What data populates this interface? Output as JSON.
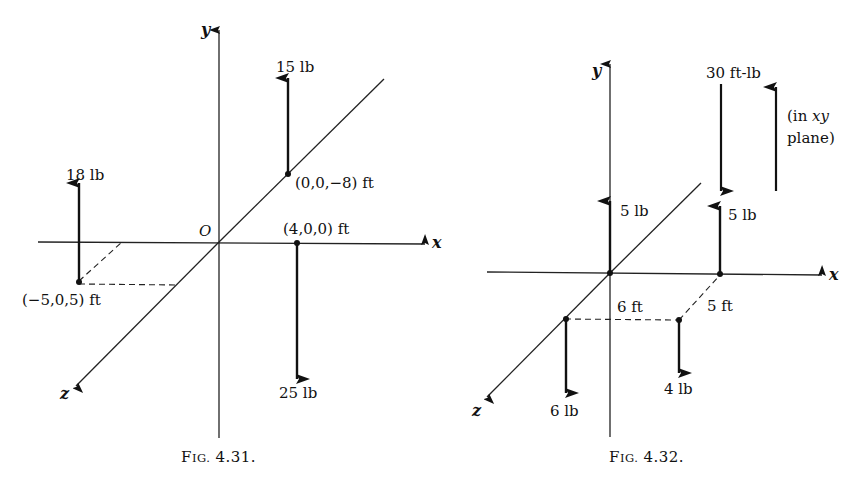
{
  "figures": [
    {
      "id": "fig-4-31",
      "caption": {
        "prefix": "F",
        "smallcaps": "IG.",
        "number": "4.31."
      },
      "axes": {
        "x": "x",
        "y": "y",
        "z": "z",
        "origin": "O"
      },
      "forces": [
        {
          "magnitude": "18 lb",
          "direction": "up",
          "point": "(−5,0,5) ft"
        },
        {
          "magnitude": "15 lb",
          "direction": "up",
          "point": "(0,0,−8) ft"
        },
        {
          "magnitude": "25 lb",
          "direction": "down",
          "point": "(4,0,0) ft"
        }
      ]
    },
    {
      "id": "fig-4-32",
      "caption": {
        "prefix": "F",
        "smallcaps": "IG.",
        "number": "4.32."
      },
      "axes": {
        "x": "x",
        "y": "y",
        "z": "z"
      },
      "forces": [
        {
          "magnitude": "5 lb",
          "direction": "up",
          "location": "origin"
        },
        {
          "magnitude": "5 lb",
          "direction": "up",
          "location": "on x axis"
        },
        {
          "magnitude": "6 lb",
          "direction": "down",
          "location": "on z axis"
        },
        {
          "magnitude": "4 lb",
          "direction": "down",
          "location": "in xz plane"
        }
      ],
      "dimensions": [
        "6 ft",
        "5 ft"
      ],
      "couple": {
        "magnitude": "30 ft-lb",
        "note_line1": "(in ",
        "note_italic": "xy",
        "note_line2": "plane)"
      }
    }
  ]
}
